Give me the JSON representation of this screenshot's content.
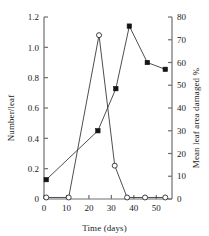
{
  "chart_data": {
    "type": "line",
    "title": "",
    "xlabel": "Time (days)",
    "ylabel": "Number/leaf",
    "ylabel_right": "Mean leaf area damaged %",
    "xlim": [
      0,
      57
    ],
    "ylim": [
      0,
      1.2
    ],
    "ylim_right": [
      0,
      80
    ],
    "xticks": [
      0,
      10,
      20,
      30,
      40,
      50
    ],
    "yticks": [
      0,
      0.2,
      0.4,
      0.6,
      0.8,
      1.0,
      1.2
    ],
    "yticks_right": [
      0,
      10,
      20,
      30,
      40,
      50,
      60,
      70,
      80
    ],
    "xticklabels": [
      "0",
      "10",
      "20",
      "30",
      "40",
      "50"
    ],
    "yticklabels": [
      "0",
      "0.2",
      "0.4",
      "0.6",
      "0.8",
      "1.0",
      "1.2"
    ],
    "yticklabels_right": [
      "0",
      "10",
      "20",
      "30",
      "40",
      "50",
      "60",
      "70",
      "80"
    ],
    "grid": false,
    "legend": "none",
    "series": [
      {
        "name": "Number/leaf",
        "marker": "open-circle",
        "axis": "left",
        "x": [
          1,
          11,
          24.5,
          31.5,
          37,
          45,
          54
        ],
        "values": [
          0.01,
          0.01,
          1.08,
          0.22,
          0.01,
          0.01,
          0.01
        ]
      },
      {
        "name": "Mean leaf area damaged %",
        "marker": "filled-square",
        "axis": "right",
        "x": [
          1,
          24,
          32,
          38,
          46,
          54
        ],
        "values": [
          8.5,
          30,
          48.5,
          76,
          60,
          57
        ]
      }
    ]
  },
  "axes": {
    "x_title": "Time (days)",
    "y_left_title": "Number/leaf",
    "y_right_title": "Mean leaf area damaged %"
  }
}
